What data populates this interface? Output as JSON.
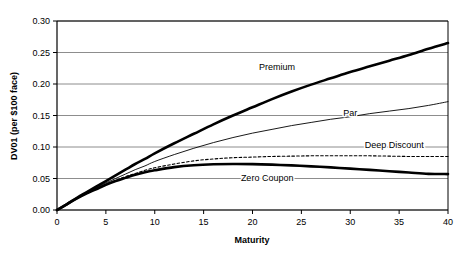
{
  "chart_data": {
    "type": "line",
    "title": "",
    "xlabel": "Maturity",
    "ylabel": "DV01 (per $100 face)",
    "xlim": [
      0,
      40
    ],
    "ylim": [
      0.0,
      0.3
    ],
    "xticks": [
      "0",
      "5",
      "10",
      "15",
      "20",
      "25",
      "30",
      "35",
      "40"
    ],
    "xtick_values": [
      0,
      5,
      10,
      15,
      20,
      25,
      30,
      35,
      40
    ],
    "yticks": [
      "0.00",
      "0.05",
      "0.10",
      "0.15",
      "0.20",
      "0.25",
      "0.30"
    ],
    "ytick_values": [
      0.0,
      0.05,
      0.1,
      0.15,
      0.2,
      0.25,
      0.3
    ],
    "grid": "horizontal",
    "legend": "inline-annotations",
    "x": [
      0,
      1,
      2,
      3,
      4,
      5,
      6,
      7,
      8,
      9,
      10,
      12,
      14,
      16,
      18,
      20,
      22,
      24,
      26,
      28,
      30,
      32,
      34,
      36,
      38,
      40
    ],
    "series": [
      {
        "name": "Premium",
        "style": "thick-solid",
        "color": "#000000",
        "label_x": 22.5,
        "label_y": 0.222,
        "values": [
          0.0,
          0.009,
          0.019,
          0.028,
          0.037,
          0.046,
          0.055,
          0.064,
          0.073,
          0.081,
          0.09,
          0.106,
          0.121,
          0.136,
          0.15,
          0.163,
          0.176,
          0.188,
          0.199,
          0.209,
          0.219,
          0.228,
          0.237,
          0.246,
          0.256,
          0.265
        ]
      },
      {
        "name": "Par",
        "style": "thin-solid",
        "color": "#000000",
        "label_x": 30.0,
        "label_y": 0.15,
        "values": [
          0.0,
          0.009,
          0.018,
          0.027,
          0.035,
          0.043,
          0.05,
          0.057,
          0.064,
          0.07,
          0.077,
          0.088,
          0.098,
          0.107,
          0.115,
          0.122,
          0.128,
          0.134,
          0.139,
          0.144,
          0.148,
          0.153,
          0.157,
          0.161,
          0.166,
          0.172
        ]
      },
      {
        "name": "Deep Discount",
        "style": "dashed",
        "color": "#000000",
        "label_x": 34.5,
        "label_y": 0.098,
        "values": [
          0.0,
          0.009,
          0.018,
          0.026,
          0.034,
          0.041,
          0.047,
          0.053,
          0.058,
          0.063,
          0.067,
          0.073,
          0.078,
          0.081,
          0.083,
          0.084,
          0.085,
          0.0855,
          0.086,
          0.086,
          0.086,
          0.086,
          0.0855,
          0.085,
          0.085,
          0.085
        ]
      },
      {
        "name": "Zero Coupon",
        "style": "thick-solid",
        "color": "#000000",
        "label_x": 21.5,
        "label_y": 0.0455,
        "values": [
          0.0,
          0.009,
          0.018,
          0.026,
          0.033,
          0.04,
          0.046,
          0.051,
          0.056,
          0.06,
          0.063,
          0.068,
          0.071,
          0.0725,
          0.073,
          0.0728,
          0.072,
          0.0708,
          0.0693,
          0.0676,
          0.0657,
          0.0637,
          0.0616,
          0.0595,
          0.0574,
          0.057
        ]
      }
    ]
  }
}
